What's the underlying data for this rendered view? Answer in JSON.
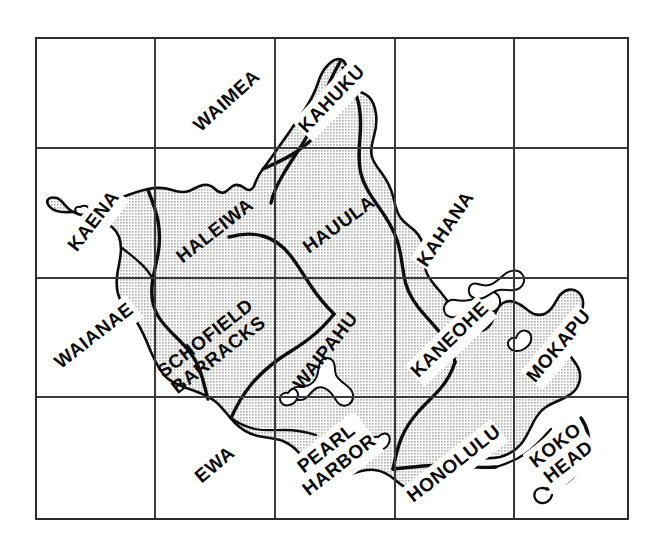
{
  "map": {
    "title": "Oahu Quadrangle Index Map",
    "region": "Oahu, Hawaii",
    "island_name": "Oahu",
    "colors": {
      "island_fill": "#cccccc",
      "coastline": "#0d0d0d",
      "grid": "#3a3a3a",
      "frame": "#2b2b2b",
      "label_text": "#0a0a0a",
      "label_banner": "#ffffff",
      "background": "#ffffff"
    },
    "grid": {
      "columns": 5,
      "rows": 4,
      "x_lines": [
        36,
        155,
        275,
        395,
        514,
        628
      ],
      "y_lines": [
        38,
        148,
        278,
        397,
        519
      ],
      "frame": {
        "x": 36,
        "y": 38,
        "width": 592,
        "height": 481
      }
    },
    "labels": [
      {
        "id": "waimea",
        "text": "WAIMEA",
        "lines": [
          "WAIMEA"
        ],
        "x": 228,
        "y": 102,
        "rotate": -42,
        "banner": true
      },
      {
        "id": "kahuku",
        "text": "KAHUKU",
        "lines": [
          "KAHUKU"
        ],
        "x": 333,
        "y": 100,
        "rotate": -46,
        "banner": true
      },
      {
        "id": "kaena",
        "text": "KAENA",
        "lines": [
          "KAENA"
        ],
        "x": 95,
        "y": 222,
        "rotate": -52,
        "banner": true
      },
      {
        "id": "haleiwa",
        "text": "HALEIWA",
        "lines": [
          "HALEIWA"
        ],
        "x": 216,
        "y": 232,
        "rotate": -38,
        "banner": false
      },
      {
        "id": "hauula",
        "text": "HAUULA",
        "lines": [
          "HAUULA"
        ],
        "x": 340,
        "y": 226,
        "rotate": -36,
        "banner": false
      },
      {
        "id": "kahana",
        "text": "KAHANA",
        "lines": [
          "KAHANA"
        ],
        "x": 447,
        "y": 230,
        "rotate": -56,
        "banner": true
      },
      {
        "id": "waianae",
        "text": "WAIANAE",
        "lines": [
          "WAIANAE"
        ],
        "x": 95,
        "y": 337,
        "rotate": -38,
        "banner": true
      },
      {
        "id": "schofield-barracks",
        "text": "SCHOFIELD BARRACKS",
        "lines": [
          "SCHOFIELD",
          "BARRACKS"
        ],
        "x": 213,
        "y": 348,
        "rotate": -38,
        "banner": false
      },
      {
        "id": "waipahu",
        "text": "WAIPAHU",
        "lines": [
          "WAIPAHU"
        ],
        "x": 327,
        "y": 352,
        "rotate": -52,
        "banner": false
      },
      {
        "id": "kaneohe",
        "text": "KANEOHE",
        "lines": [
          "KANEOHE"
        ],
        "x": 451,
        "y": 341,
        "rotate": -44,
        "banner": true
      },
      {
        "id": "mokapu",
        "text": "MOKAPU",
        "lines": [
          "MOKAPU"
        ],
        "x": 560,
        "y": 347,
        "rotate": -50,
        "banner": true
      },
      {
        "id": "ewa",
        "text": "EWA",
        "lines": [
          "EWA"
        ],
        "x": 216,
        "y": 466,
        "rotate": -40,
        "banner": true
      },
      {
        "id": "pearl-harbor",
        "text": "PEARL HARBOR",
        "lines": [
          "PEARL",
          "HARBOR"
        ],
        "x": 334,
        "y": 458,
        "rotate": -38,
        "banner": true
      },
      {
        "id": "honolulu",
        "text": "HONOLULU",
        "lines": [
          "HONOLULU"
        ],
        "x": 455,
        "y": 465,
        "rotate": -38,
        "banner": true
      },
      {
        "id": "koko-head",
        "text": "KOKO HEAD",
        "lines": [
          "KOKO",
          "HEAD"
        ],
        "x": 563,
        "y": 455,
        "rotate": -38,
        "banner": true
      }
    ]
  }
}
